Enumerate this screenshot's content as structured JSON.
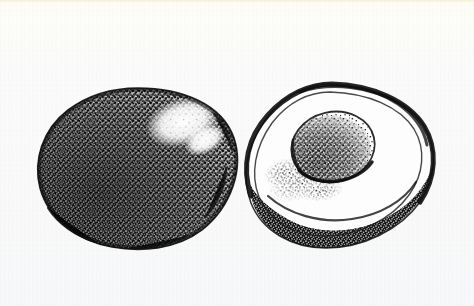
{
  "figure": {
    "title": "Avocado",
    "medium": "stipple / pen-and-ink botanical illustration",
    "color_mode": "black-and-white",
    "caption": "",
    "background_color": "#fbfbf9",
    "ink_color": "#121212",
    "flesh_color": "#ffffff",
    "width": 474,
    "height": 306
  },
  "subjects": [
    {
      "id": "whole-fruit",
      "label": "Whole avocado",
      "description": "Intact pear-to-oval shaped avocado rendered entirely in dense black stipple, with a bright unshaded highlight on the upper right shoulder.",
      "bbox": {
        "x": 38,
        "y": 88,
        "width": 200,
        "height": 160
      },
      "highlight": {
        "label": "Specular highlight",
        "x": 152,
        "y": 104,
        "width": 62,
        "height": 38
      },
      "texture": "dense-stipple",
      "shading": "darkest at lower-left and outer rim, lightest at upper-right"
    },
    {
      "id": "half-fruit",
      "label": "Halved avocado with pit",
      "description": "Avocado cut lengthwise showing pale flesh, a dark stippled skin rim along the lower edge, and a large round pit seated in the hollow.",
      "bbox": {
        "x": 246,
        "y": 84,
        "width": 188,
        "height": 164
      },
      "parts": [
        {
          "id": "flesh",
          "label": "Flesh",
          "tone": "white"
        },
        {
          "id": "skin-rim",
          "label": "Skin rim",
          "tone": "dark stipple band"
        },
        {
          "id": "pit",
          "label": "Pit (seed)",
          "tone": "medium stipple",
          "bbox": {
            "x": 292,
            "y": 112,
            "width": 82,
            "height": 70
          }
        },
        {
          "id": "stipple-spill",
          "label": "Shadow stipple below pit",
          "tone": "scattered stipple"
        }
      ]
    }
  ]
}
